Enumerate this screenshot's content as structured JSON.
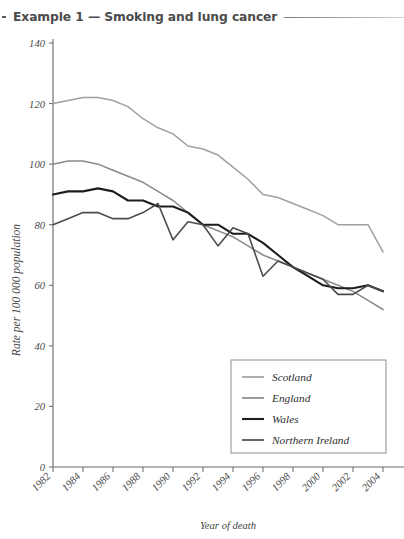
{
  "figure": {
    "title": "Example 1 — Smoking and lung cancer"
  },
  "chart_data": {
    "type": "line",
    "title": "Example 1 — Smoking and lung cancer",
    "xlabel": "Year of death",
    "ylabel": "Rate per 100 000 population",
    "x": [
      1982,
      1983,
      1984,
      1985,
      1986,
      1987,
      1988,
      1989,
      1990,
      1991,
      1992,
      1993,
      1994,
      1995,
      1996,
      1997,
      1998,
      1999,
      2000,
      2001,
      2002,
      2003,
      2004
    ],
    "xticks": [
      1982,
      1984,
      1986,
      1988,
      1990,
      1992,
      1994,
      1996,
      1998,
      2000,
      2002,
      2004
    ],
    "yticks": [
      0,
      20,
      40,
      60,
      80,
      100,
      120,
      140
    ],
    "xlim": [
      1982,
      2004
    ],
    "ylim": [
      0,
      140
    ],
    "grid": false,
    "legend_position": "lower-right",
    "series": [
      {
        "name": "Scotland",
        "color": "#a0a0a2",
        "width": 1.5,
        "values": [
          120,
          121,
          122,
          122,
          121,
          119,
          115,
          112,
          110,
          106,
          105,
          103,
          99,
          95,
          90,
          89,
          87,
          85,
          83,
          80,
          80,
          80,
          71
        ]
      },
      {
        "name": "England",
        "color": "#8a8a8c",
        "width": 1.5,
        "values": [
          100,
          101,
          101,
          100,
          98,
          96,
          94,
          91,
          88,
          84,
          80,
          78,
          76,
          73,
          70,
          68,
          66,
          64,
          62,
          60,
          58,
          55,
          52
        ]
      },
      {
        "name": "Wales",
        "color": "#1d1d1f",
        "width": 2.1,
        "values": [
          90,
          91,
          91,
          92,
          91,
          88,
          88,
          86,
          86,
          84,
          80,
          80,
          77,
          77,
          74,
          70,
          66,
          63,
          60,
          59,
          59,
          60,
          58
        ]
      },
      {
        "name": "Northern Ireland",
        "color": "#4c4c4e",
        "width": 1.6,
        "values": [
          80,
          82,
          84,
          84,
          82,
          82,
          84,
          87,
          75,
          81,
          80,
          73,
          79,
          77,
          63,
          68,
          66,
          64,
          62,
          57,
          57,
          60,
          58
        ]
      }
    ]
  }
}
